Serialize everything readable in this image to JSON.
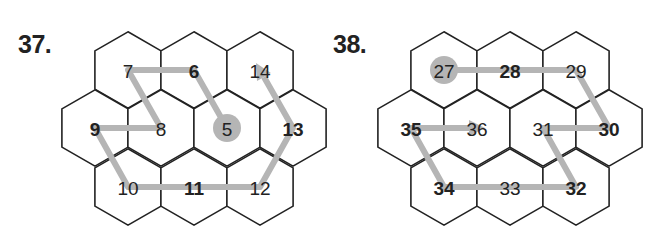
{
  "colors": {
    "hex_stroke": "#222222",
    "path": "#b5b5b5",
    "text": "#222222",
    "start_dot": "#b5b5b5"
  },
  "puzzles": [
    {
      "label": "37.",
      "cells": [
        {
          "row": 0,
          "col": 0,
          "value": "7",
          "bold": false
        },
        {
          "row": 0,
          "col": 1,
          "value": "6",
          "bold": true
        },
        {
          "row": 0,
          "col": 2,
          "value": "14",
          "bold": false
        },
        {
          "row": 1,
          "col": 0,
          "value": "9",
          "bold": true
        },
        {
          "row": 1,
          "col": 1,
          "value": "8",
          "bold": false
        },
        {
          "row": 1,
          "col": 2,
          "value": "5",
          "bold": false,
          "start": true
        },
        {
          "row": 1,
          "col": 3,
          "value": "13",
          "bold": true
        },
        {
          "row": 2,
          "col": 0,
          "value": "10",
          "bold": false
        },
        {
          "row": 2,
          "col": 1,
          "value": "11",
          "bold": true
        },
        {
          "row": 2,
          "col": 2,
          "value": "12",
          "bold": false
        }
      ],
      "path_order": [
        "5",
        "6",
        "7",
        "8",
        "9",
        "10",
        "11",
        "12",
        "13",
        "14"
      ]
    },
    {
      "label": "38.",
      "cells": [
        {
          "row": 0,
          "col": 0,
          "value": "27",
          "bold": false,
          "start": true
        },
        {
          "row": 0,
          "col": 1,
          "value": "28",
          "bold": true
        },
        {
          "row": 0,
          "col": 2,
          "value": "29",
          "bold": false
        },
        {
          "row": 1,
          "col": 0,
          "value": "35",
          "bold": true
        },
        {
          "row": 1,
          "col": 1,
          "value": "36",
          "bold": false
        },
        {
          "row": 1,
          "col": 2,
          "value": "31",
          "bold": false
        },
        {
          "row": 1,
          "col": 3,
          "value": "30",
          "bold": true
        },
        {
          "row": 2,
          "col": 0,
          "value": "34",
          "bold": true
        },
        {
          "row": 2,
          "col": 1,
          "value": "33",
          "bold": false
        },
        {
          "row": 2,
          "col": 2,
          "value": "32",
          "bold": true
        }
      ],
      "path_order": [
        "27",
        "28",
        "29",
        "30",
        "31",
        "32",
        "33",
        "34",
        "35",
        "36"
      ]
    }
  ]
}
